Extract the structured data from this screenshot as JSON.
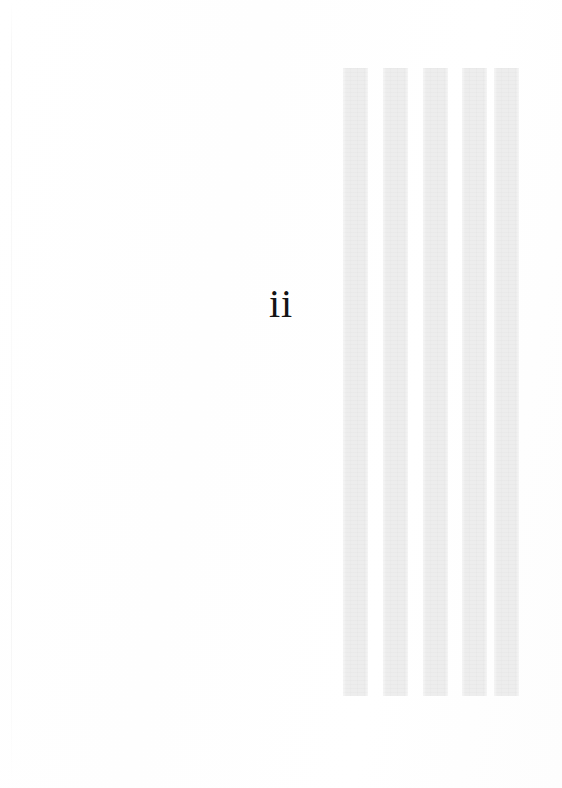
{
  "document": {
    "type": "scanned-book-page",
    "page_label": "ii",
    "background_color": "#ffffff"
  },
  "page_number": {
    "text": "ii",
    "color": "#141414",
    "left_px": 0,
    "top_px": 284,
    "font_size_px": 40
  },
  "artifact_bars": {
    "name": "vertical-grey-bars",
    "color": "#ededed",
    "count": 5,
    "left_px": 343,
    "top_px": 68,
    "width_px": 25,
    "height_px": 628,
    "gap_px": 15,
    "bars": [
      {
        "index": 1,
        "left_px": 343,
        "width_px": 25
      },
      {
        "index": 2,
        "left_px": 383,
        "width_px": 25
      },
      {
        "index": 3,
        "left_px": 423,
        "width_px": 25
      },
      {
        "index": 4,
        "left_px": 462,
        "width_px": 25
      },
      {
        "index": 5,
        "left_px": 494,
        "width_px": 25
      }
    ]
  },
  "scan_seam": {
    "name": "left-scan-seam",
    "left_px": 11,
    "color": "rgba(0,0,0,0.045)"
  }
}
